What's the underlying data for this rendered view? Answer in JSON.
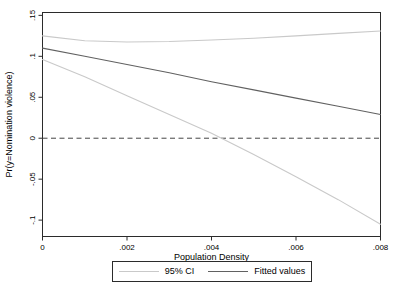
{
  "chart_data": {
    "type": "line",
    "title": "",
    "xlabel": "Population Density",
    "ylabel": "Pr(y=Nomination violence)",
    "xlim": [
      0,
      0.008
    ],
    "ylim": [
      -0.12,
      0.1535
    ],
    "xticks": [
      0,
      0.002,
      0.004,
      0.006,
      0.008
    ],
    "xtick_labels": [
      "0",
      ".002",
      ".004",
      ".006",
      ".008"
    ],
    "yticks": [
      -0.1,
      -0.05,
      0,
      0.05,
      0.1,
      0.15
    ],
    "ytick_labels": [
      "-.1",
      "-.05",
      "0",
      ".05",
      ".1",
      ".15"
    ],
    "grid": false,
    "zero_line": {
      "y": 0,
      "style": "dashed",
      "color": "#444444"
    },
    "x": [
      0,
      0.001,
      0.002,
      0.003,
      0.004,
      0.005,
      0.006,
      0.007,
      0.008
    ],
    "series": [
      {
        "id": "ci-upper-line",
        "name": "95% CI (upper bound)",
        "color": "#c9c9c9",
        "values": [
          0.125,
          0.119,
          0.1175,
          0.118,
          0.12,
          0.122,
          0.125,
          0.128,
          0.131
        ]
      },
      {
        "id": "ci-lower-line",
        "name": "95% CI (lower bound)",
        "color": "#c9c9c9",
        "values": [
          0.096,
          0.075,
          0.052,
          0.029,
          0.006,
          -0.02,
          -0.047,
          -0.075,
          -0.105
        ]
      },
      {
        "id": "fitted-line",
        "name": "Fitted values",
        "color": "#616161",
        "values": [
          0.11,
          0.1,
          0.09,
          0.08,
          0.069,
          0.059,
          0.049,
          0.039,
          0.029
        ]
      }
    ],
    "legend": {
      "position": "bottom-center",
      "entries": [
        {
          "label": "95% CI",
          "color": "#c9c9c9"
        },
        {
          "label": "Fitted values",
          "color": "#616161"
        }
      ]
    },
    "frame_color": "#2b2b2b",
    "text_color": "#000000",
    "background": "#ffffff"
  }
}
